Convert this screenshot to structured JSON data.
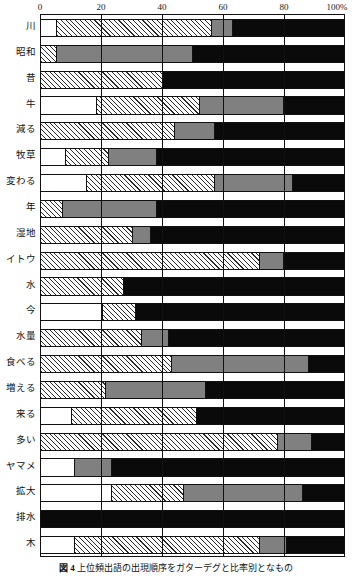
{
  "chart_data": {
    "type": "bar",
    "orientation": "horizontal",
    "stacked": true,
    "normalized": true,
    "title": "",
    "xlabel": "",
    "ylabel": "",
    "xlim": [
      0,
      100
    ],
    "xticks": [
      "0",
      "20",
      "40",
      "60",
      "80",
      "100%"
    ],
    "xtick_values": [
      0,
      20,
      40,
      60,
      80,
      100
    ],
    "grid": true,
    "legend": "none",
    "series": [
      {
        "name": "white",
        "fill": "white"
      },
      {
        "name": "hatched",
        "fill": "diagonal-hatch"
      },
      {
        "name": "gray",
        "fill": "gray"
      },
      {
        "name": "black",
        "fill": "black"
      }
    ],
    "categories": [
      "川",
      "昭和",
      "昔",
      "牛",
      "減る",
      "牧草",
      "変わる",
      "年",
      "湿地",
      "イトウ",
      "水",
      "今",
      "水量",
      "食べる",
      "増える",
      "来る",
      "多い",
      "ヤマメ",
      "拡大",
      "排水",
      "木"
    ],
    "rows": [
      {
        "label": "川",
        "segments": [
          {
            "fill": "white",
            "value": 5
          },
          {
            "fill": "hatch",
            "value": 51
          },
          {
            "fill": "gray",
            "value": 7
          },
          {
            "fill": "black",
            "value": 37
          }
        ]
      },
      {
        "label": "昭和",
        "segments": [
          {
            "fill": "hatch",
            "value": 5
          },
          {
            "fill": "gray",
            "value": 45
          },
          {
            "fill": "black",
            "value": 50
          }
        ]
      },
      {
        "label": "昔",
        "segments": [
          {
            "fill": "hatch",
            "value": 40
          },
          {
            "fill": "black",
            "value": 60
          }
        ]
      },
      {
        "label": "牛",
        "segments": [
          {
            "fill": "white",
            "value": 18
          },
          {
            "fill": "hatch",
            "value": 34
          },
          {
            "fill": "gray",
            "value": 28
          },
          {
            "fill": "black",
            "value": 20
          }
        ]
      },
      {
        "label": "減る",
        "segments": [
          {
            "fill": "hatch",
            "value": 44
          },
          {
            "fill": "gray",
            "value": 13
          },
          {
            "fill": "black",
            "value": 43
          }
        ]
      },
      {
        "label": "牧草",
        "segments": [
          {
            "fill": "white",
            "value": 8
          },
          {
            "fill": "hatch",
            "value": 14
          },
          {
            "fill": "gray",
            "value": 16
          },
          {
            "fill": "black",
            "value": 62
          }
        ]
      },
      {
        "label": "変わる",
        "segments": [
          {
            "fill": "white",
            "value": 15
          },
          {
            "fill": "hatch",
            "value": 42
          },
          {
            "fill": "gray",
            "value": 26
          },
          {
            "fill": "black",
            "value": 17
          }
        ]
      },
      {
        "label": "年",
        "segments": [
          {
            "fill": "hatch",
            "value": 7
          },
          {
            "fill": "gray",
            "value": 31
          },
          {
            "fill": "black",
            "value": 62
          }
        ]
      },
      {
        "label": "湿地",
        "segments": [
          {
            "fill": "hatch",
            "value": 30
          },
          {
            "fill": "gray",
            "value": 6
          },
          {
            "fill": "black",
            "value": 64
          }
        ]
      },
      {
        "label": "イトウ",
        "segments": [
          {
            "fill": "hatch",
            "value": 72
          },
          {
            "fill": "gray",
            "value": 8
          },
          {
            "fill": "black",
            "value": 20
          }
        ]
      },
      {
        "label": "水",
        "segments": [
          {
            "fill": "hatch",
            "value": 27
          },
          {
            "fill": "black",
            "value": 73
          }
        ]
      },
      {
        "label": "今",
        "segments": [
          {
            "fill": "white",
            "value": 20
          },
          {
            "fill": "hatch",
            "value": 11
          },
          {
            "fill": "black",
            "value": 69
          }
        ]
      },
      {
        "label": "水量",
        "segments": [
          {
            "fill": "hatch",
            "value": 33
          },
          {
            "fill": "gray",
            "value": 9
          },
          {
            "fill": "black",
            "value": 58
          }
        ]
      },
      {
        "label": "食べる",
        "segments": [
          {
            "fill": "hatch",
            "value": 43
          },
          {
            "fill": "gray",
            "value": 45
          },
          {
            "fill": "black",
            "value": 12
          }
        ]
      },
      {
        "label": "増える",
        "segments": [
          {
            "fill": "hatch",
            "value": 21
          },
          {
            "fill": "gray",
            "value": 33
          },
          {
            "fill": "black",
            "value": 46
          }
        ]
      },
      {
        "label": "来る",
        "segments": [
          {
            "fill": "white",
            "value": 10
          },
          {
            "fill": "hatch",
            "value": 41
          },
          {
            "fill": "black",
            "value": 49
          }
        ]
      },
      {
        "label": "多い",
        "segments": [
          {
            "fill": "hatch",
            "value": 78
          },
          {
            "fill": "gray",
            "value": 11
          },
          {
            "fill": "black",
            "value": 11
          }
        ]
      },
      {
        "label": "ヤマメ",
        "segments": [
          {
            "fill": "white",
            "value": 11
          },
          {
            "fill": "gray",
            "value": 12
          },
          {
            "fill": "black",
            "value": 77
          }
        ]
      },
      {
        "label": "拡大",
        "segments": [
          {
            "fill": "white",
            "value": 23
          },
          {
            "fill": "hatch",
            "value": 24
          },
          {
            "fill": "gray",
            "value": 39
          },
          {
            "fill": "black",
            "value": 14
          }
        ]
      },
      {
        "label": "排水",
        "segments": [
          {
            "fill": "black",
            "value": 100
          }
        ]
      },
      {
        "label": "木",
        "segments": [
          {
            "fill": "white",
            "value": 11
          },
          {
            "fill": "hatch",
            "value": 61
          },
          {
            "fill": "gray",
            "value": 9
          },
          {
            "fill": "black",
            "value": 19
          }
        ]
      }
    ]
  },
  "caption": {
    "figure_number": "図 4",
    "text": "上位頻出語の出現順序をガターデグと比率別となもの"
  },
  "colors": {
    "white": "#ffffff",
    "gray": "#808080",
    "black": "#0a0a0a",
    "line": "#111111"
  }
}
